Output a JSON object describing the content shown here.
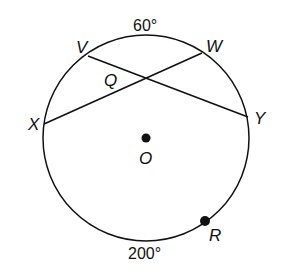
{
  "diagram": {
    "type": "circle-with-intersecting-chords",
    "circle": {
      "center_label": "O",
      "cx": 146,
      "cy": 138,
      "r": 103
    },
    "points": {
      "V": {
        "label": "V",
        "x": 88,
        "y": 56
      },
      "W": {
        "label": "W",
        "x": 202,
        "y": 53
      },
      "X": {
        "label": "X",
        "x": 44,
        "y": 124
      },
      "Y": {
        "label": "Y",
        "x": 248,
        "y": 117
      },
      "R": {
        "label": "R",
        "x": 205,
        "y": 221
      },
      "Q": {
        "label": "Q"
      },
      "O": {
        "label": "O"
      }
    },
    "chords": [
      "VY",
      "XW"
    ],
    "arc_labels": {
      "top": "60°",
      "bottom": "200°"
    },
    "stroke_color": "#111111"
  }
}
